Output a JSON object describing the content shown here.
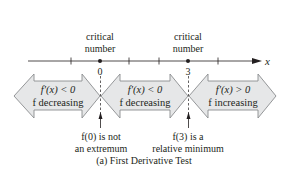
{
  "diagram": {
    "axis_label": "x",
    "critical_points": [
      {
        "label_line1": "critical",
        "label_line2": "number",
        "value": "0"
      },
      {
        "label_line1": "critical",
        "label_line2": "number",
        "value": "3"
      }
    ],
    "intervals": [
      {
        "line1": "f′(x) < 0",
        "line2": "f decreasing"
      },
      {
        "line1": "f′(x) < 0",
        "line2": "f decreasing"
      },
      {
        "line1": "f′(x) > 0",
        "line2": "f increasing"
      }
    ],
    "annotations": [
      {
        "line1": "f(0) is not",
        "line2": "an extremum"
      },
      {
        "line1": "f(3) is a",
        "line2": "relative minimum"
      }
    ],
    "caption": "(a) First Derivative Test",
    "colors": {
      "arrow_fill": "#e6e7e8",
      "arrow_stroke": "#8a8c8e",
      "ink": "#231f20"
    }
  }
}
